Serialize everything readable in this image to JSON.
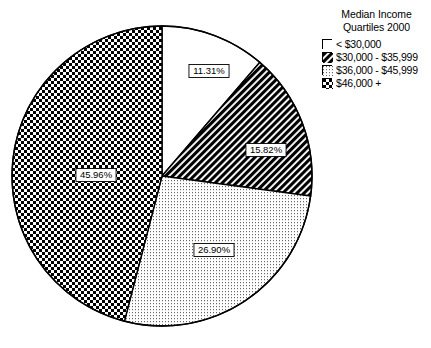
{
  "chart_data": {
    "type": "pie",
    "title": "Median Income Quartiles 2000",
    "title_line1": "Median Income",
    "title_line2": "Quartiles 2000",
    "xlabel": "",
    "ylabel": "",
    "legend_position": "right",
    "grid": false,
    "categories": [
      "< $30,000",
      "$30,000 - $35,999",
      "$36,000 - $45,999",
      "$46,000 +"
    ],
    "values": [
      11.31,
      15.82,
      26.9,
      45.96
    ],
    "value_labels": [
      "11.31%",
      "15.82%",
      "26.90%",
      "45.96%"
    ],
    "units": "percent",
    "start_angle_deg": 0,
    "direction": "clockwise",
    "slices": [
      {
        "label": "< $30,000",
        "value": 11.31,
        "value_label": "11.31%",
        "fill": "solid-white",
        "fill_color": "#ffffff",
        "stroke_color": "#000000",
        "start_deg": 0,
        "end_deg": 40.716,
        "label_x": 209,
        "label_y": 71
      },
      {
        "label": "$30,000 - $35,999",
        "value": 15.82,
        "value_label": "15.82%",
        "fill": "diagonal-hatch",
        "fill_color": "#1a1a1a",
        "stroke_color": "#000000",
        "start_deg": 40.716,
        "end_deg": 97.668,
        "label_x": 266,
        "label_y": 150
      },
      {
        "label": "$36,000 - $45,999",
        "value": 26.9,
        "value_label": "26.90%",
        "fill": "fine-dots",
        "fill_color": "#ededed",
        "stroke_color": "#000000",
        "start_deg": 97.668,
        "end_deg": 194.508,
        "label_x": 214,
        "label_y": 250
      },
      {
        "label": "$46,000 +",
        "value": 45.96,
        "value_label": "45.96%",
        "fill": "checkerboard",
        "fill_color": "#262626",
        "stroke_color": "#000000",
        "start_deg": 194.508,
        "end_deg": 360,
        "label_x": 96,
        "label_y": 175
      }
    ],
    "geometry": {
      "center_x": 162,
      "center_y": 176,
      "radius": 150
    }
  },
  "legend": {
    "title_line1": "Median Income",
    "title_line2": "Quartiles 2000",
    "items": [
      {
        "label": "< $30,000",
        "swatch": "solid-white"
      },
      {
        "label": "$30,000 - $35,999",
        "swatch": "diagonal-hatch"
      },
      {
        "label": "$36,000 - $45,999",
        "swatch": "fine-dots"
      },
      {
        "label": "$46,000 +",
        "swatch": "checkerboard"
      }
    ]
  },
  "colors": {
    "background": "#ffffff",
    "outline": "#000000",
    "slice_white": "#ffffff",
    "slice_hatch": "#1a1a1a",
    "slice_dots": "#ededed",
    "slice_checker": "#262626"
  }
}
